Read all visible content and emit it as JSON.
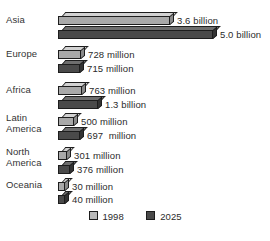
{
  "chart_data": {
    "type": "bar",
    "title": "",
    "subtitle": "",
    "xlabel": "",
    "ylabel": "",
    "orientation": "horizontal",
    "grid": false,
    "legend_position": "bottom-center",
    "categories": [
      "Asia",
      "Europe",
      "Africa",
      "Latin\nAmerica",
      "North\nAmerica",
      "Oceania"
    ],
    "series": [
      {
        "name": "1998",
        "color": "#b9b9b9",
        "values": [
          3600,
          728,
          763,
          500,
          301,
          30
        ],
        "labels": [
          "3.6 billion",
          "728 million",
          "763 million",
          "500 million",
          "301 million",
          "30 million"
        ]
      },
      {
        "name": "2025",
        "color": "#4a4a4a",
        "values": [
          5000,
          715,
          1300,
          697,
          376,
          40
        ],
        "labels": [
          "5.0 billion",
          "715 million",
          "1.3 billion",
          "697  million",
          "376 million",
          "40 million"
        ]
      }
    ],
    "units": "millions of people",
    "xlim": [
      0,
      5000
    ]
  },
  "legend": {
    "items": [
      {
        "label": "1998",
        "color": "#b9b9b9"
      },
      {
        "label": "2025",
        "color": "#4a4a4a"
      }
    ]
  },
  "colors": {
    "background": "#ffffff",
    "text": "#2b2b2b",
    "bar_1998": "#b9b9b9",
    "bar_2025": "#4a4a4a",
    "outline": "#1d1d1d"
  }
}
